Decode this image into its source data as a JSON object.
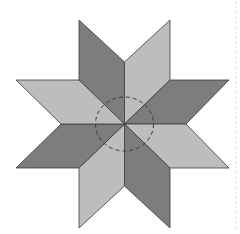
{
  "figure": {
    "title": "",
    "colors": {
      "dark": "#7d7d7d",
      "light": "#bdbdbd",
      "stroke": "#3a3a3a",
      "dashed_circle": "#3a3a3a",
      "side_dots": "#c8c8c8",
      "background": "#ffffff"
    },
    "center": [
      124.5,
      124
    ],
    "rhombi": [
      {
        "name": "rhombus-top-left",
        "shade": "dark",
        "points": "124.5,124 79,80 79,20 124.5,62"
      },
      {
        "name": "rhombus-top-right",
        "shade": "light",
        "points": "124.5,124 124.5,62 170,20 170,80"
      },
      {
        "name": "rhombus-right-upper",
        "shade": "dark",
        "points": "124.5,124 170,80 229,80 186,124"
      },
      {
        "name": "rhombus-right-lower",
        "shade": "light",
        "points": "124.5,124 186,124 229,168 170,168"
      },
      {
        "name": "rhombus-bottom-right",
        "shade": "dark",
        "points": "124.5,124 170,168 170,228 124.5,186"
      },
      {
        "name": "rhombus-bottom-left",
        "shade": "light",
        "points": "124.5,124 124.5,186 79,228 79,168"
      },
      {
        "name": "rhombus-left-lower",
        "shade": "dark",
        "points": "124.5,124 79,168 16,168 61,124"
      },
      {
        "name": "rhombus-left-upper",
        "shade": "light",
        "points": "124.5,124 61,124 16,80 79,80"
      }
    ],
    "circle": {
      "cx": 124.5,
      "cy": 124,
      "rx": 29,
      "ry": 27
    }
  }
}
